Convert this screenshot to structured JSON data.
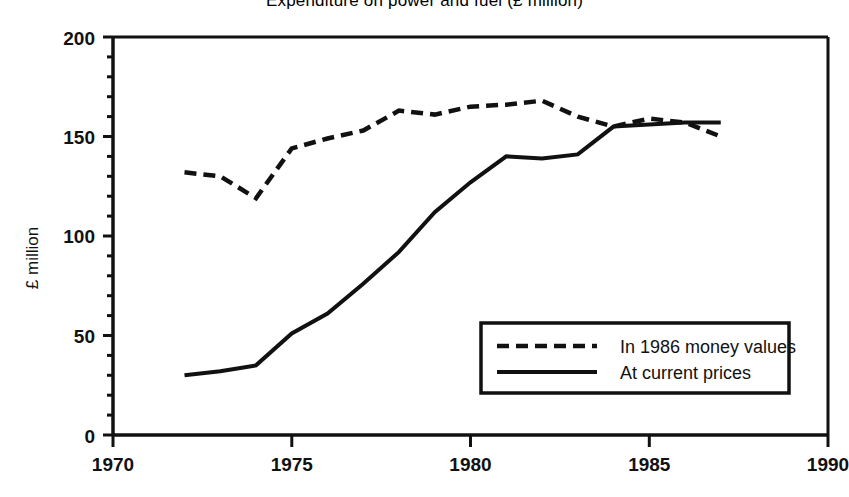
{
  "chart_data": {
    "type": "line",
    "title": "Expenditure on power and fuel (£ million)",
    "xlabel": "",
    "ylabel": "£ million",
    "xlim": [
      1970,
      1990
    ],
    "ylim": [
      0,
      200
    ],
    "xticks": [
      "1970",
      "1975",
      "1980",
      "1985",
      "1990"
    ],
    "yticks": [
      "0",
      "50",
      "100",
      "150",
      "200"
    ],
    "xtick_values": [
      1970,
      1975,
      1980,
      1985,
      1990
    ],
    "ytick_values": [
      0,
      50,
      100,
      150,
      200
    ],
    "minor_ytick_step": 10,
    "grid": false,
    "legend_position": "lower right",
    "x": [
      1972,
      1973,
      1974,
      1975,
      1976,
      1977,
      1978,
      1979,
      1980,
      1981,
      1982,
      1983,
      1984,
      1985,
      1986,
      1987
    ],
    "series": [
      {
        "name": "In 1986 money values",
        "style": "dashed",
        "color": "#111111",
        "x": [
          1972,
          1973,
          1974,
          1975,
          1976,
          1977,
          1978,
          1979,
          1980,
          1981,
          1982,
          1983,
          1984,
          1985,
          1986,
          1987
        ],
        "values": [
          132,
          130,
          119,
          144,
          149,
          153,
          163,
          161,
          165,
          166,
          168,
          160,
          155,
          159,
          157,
          150
        ]
      },
      {
        "name": "At current prices",
        "style": "solid",
        "color": "#111111",
        "x": [
          1972,
          1973,
          1974,
          1975,
          1976,
          1977,
          1978,
          1979,
          1980,
          1981,
          1982,
          1983,
          1984,
          1985,
          1986,
          1987
        ],
        "values": [
          30,
          32,
          35,
          51,
          61,
          76,
          92,
          112,
          127,
          140,
          139,
          141,
          155,
          156,
          157,
          157
        ]
      }
    ]
  },
  "legend": {
    "items": [
      {
        "label": "In 1986 money values",
        "style": "dashed"
      },
      {
        "label": "At current prices",
        "style": "solid"
      }
    ]
  },
  "axes": {
    "y_label": "£ million",
    "y_ticks": [
      "200",
      "150",
      "100",
      "50",
      "0"
    ],
    "x_ticks": [
      "1970",
      "1975",
      "1980",
      "1985",
      "1990"
    ]
  }
}
